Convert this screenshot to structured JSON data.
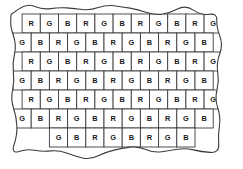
{
  "figure": {
    "background_color": "#ffffff",
    "line_color": "#3c3c3c",
    "label_color": "#1a1a1a"
  },
  "legend": {
    "codes": [
      {
        "code": "R",
        "name": "red-filter"
      },
      {
        "code": "G",
        "name": "green-filter"
      },
      {
        "code": "B",
        "name": "blue-filter"
      }
    ]
  },
  "mosaic": {
    "cell_width": 18.2,
    "cell_height": 19.0,
    "origin_x": 13.0,
    "origin_y": 14.0,
    "row_offset": 9.1,
    "rows": [
      {
        "index": 0,
        "indent_cells": 0.5,
        "cells": [
          "R",
          "G",
          "B",
          "R",
          "G",
          "B",
          "R",
          "G",
          "B",
          "R",
          "G"
        ]
      },
      {
        "index": 1,
        "indent_cells": 0.0,
        "cells": [
          "G",
          "B",
          "R",
          "G",
          "B",
          "R",
          "G",
          "B",
          "R",
          "G",
          "B"
        ]
      },
      {
        "index": 2,
        "indent_cells": 0.5,
        "cells": [
          "R",
          "G",
          "B",
          "R",
          "G",
          "B",
          "R",
          "G",
          "B",
          "R",
          "G"
        ]
      },
      {
        "index": 3,
        "indent_cells": 0.0,
        "cells": [
          "G",
          "B",
          "R",
          "G",
          "B",
          "R",
          "G",
          "B",
          "R",
          "G",
          "B"
        ]
      },
      {
        "index": 4,
        "indent_cells": 0.5,
        "cells": [
          "R",
          "G",
          "B",
          "R",
          "G",
          "B",
          "R",
          "G",
          "B",
          "R",
          "G"
        ]
      },
      {
        "index": 5,
        "indent_cells": 0.0,
        "cells": [
          "G",
          "B",
          "R",
          "G",
          "B",
          "R",
          "G",
          "B",
          "R",
          "G",
          "B"
        ]
      },
      {
        "index": 6,
        "indent_cells": 2.0,
        "cells": [
          "G",
          "B",
          "R",
          "G",
          "B",
          "R",
          "G",
          "B"
        ]
      }
    ]
  },
  "boundary": {
    "name": "torn-edge-outline",
    "path": "M 30 22 C 26 17 22 16 20 20 C 18 25 22 27 24 30 C 20 31 16 31 15 36 C 14 41 18 43 21 45 C 16 46 12 48 13 53 C 14 58 19 59 23 60 C 18 62 14 64 15 69 C 16 74 21 75 25 76 C 20 78 16 80 17 85 C 18 90 23 91 27 92 C 22 94 18 96 19 101 C 20 106 25 107 29 108 C 24 110 20 112 21 117 C 22 122 27 123 31 124 C 27 128 24 132 28 136 C 32 140 37 137 41 134 C 44 139 48 143 53 141 C 58 139 58 134 57 130 C 63 133 69 135 73 131 C 77 127 74 122 71 119 C 78 120 85 120 87 115 C 89 110 84 107 80 105 C 88 105 95 104 96 99 C 97 94 92 91 88 90 C 96 89 103 87 103 82 C 103 77 97 75 93 75 C 101 73 108 70 107 65 C 106 60 100 59 96 60 C 103 57 109 53 107 48 C 105 43 99 43 95 45 C 101 41 106 36 103 31 C 100 26 94 28 90 31 C 95 26 98 20 94 16 C 90 12 85 15 82 19 C 85 13 86 7 81 5 C 76 3 72 7 70 11 C 71 5 70 0 65 0 C 60 0 58 5 58 10 C 56 4 52 0 47 2 C 42 4 42 9 43 14 C 39 10 34 7 30 11 C 26 15 27 19 30 22 Z",
    "note": "irregular hand-drawn outline enclosing the mosaic"
  }
}
